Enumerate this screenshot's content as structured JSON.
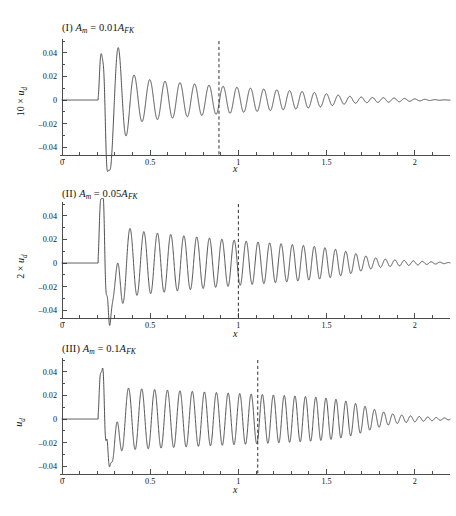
{
  "figure": {
    "background": "#ffffff",
    "curve_color": "#3c3c3c",
    "axis_color": "#4d4d4d",
    "marker_color": "#2e2e2e"
  },
  "panels": [
    {
      "id": "panel-I",
      "title_roman": "(I)",
      "title_full": "(I) A_m = 0.01A_FK",
      "amplitude_symbol": "A",
      "amplitude_sub": "m",
      "equals": " = ",
      "coefficient": "0.01",
      "reference_symbol": "A",
      "reference_sub": "FK",
      "ylabel_full": "10 × u_d",
      "ylabel_prefix": "10 × ",
      "ylabel_symbol": "u",
      "ylabel_sub": "d",
      "xlabel": "x",
      "yticks": [
        "0.04",
        "0.02",
        "0",
        "–0.02",
        "–0.04"
      ],
      "ytick_values": [
        0.04,
        0.02,
        0,
        -0.02,
        -0.04
      ],
      "xticks": [
        "0",
        "0.5",
        "1",
        "1.5",
        "2"
      ],
      "xtick_values": [
        0,
        0.5,
        1,
        1.5,
        2
      ],
      "marker_x": 0.89,
      "marker_label": "0.89"
    },
    {
      "id": "panel-II",
      "title_roman": "(II)",
      "title_full": "(II) A_m = 0.05A_FK",
      "amplitude_symbol": "A",
      "amplitude_sub": "m",
      "equals": " = ",
      "coefficient": "0.05",
      "reference_symbol": "A",
      "reference_sub": "FK",
      "ylabel_full": "2 × u_d",
      "ylabel_prefix": "2 × ",
      "ylabel_symbol": "u",
      "ylabel_sub": "d",
      "xlabel": "x",
      "yticks": [
        "0.04",
        "0.02",
        "0",
        "–0.02",
        "–0.04"
      ],
      "ytick_values": [
        0.04,
        0.02,
        0,
        -0.02,
        -0.04
      ],
      "xticks": [
        "0",
        "0.5",
        "1",
        "1.5",
        "2"
      ],
      "xtick_values": [
        0,
        0.5,
        1,
        1.5,
        2
      ],
      "marker_x": 1.0,
      "marker_label": "1"
    },
    {
      "id": "panel-III",
      "title_roman": "(III)",
      "title_full": "(III) A_m = 0.1A_FK",
      "amplitude_symbol": "A",
      "amplitude_sub": "m",
      "equals": " = ",
      "coefficient": "0.1",
      "reference_symbol": "A",
      "reference_sub": "FK",
      "ylabel_full": "u_d",
      "ylabel_prefix": "",
      "ylabel_symbol": "u",
      "ylabel_sub": "d",
      "xlabel": "x",
      "yticks": [
        "0.04",
        "0.02",
        "0",
        "–0.02",
        "–0.04"
      ],
      "ytick_values": [
        0.04,
        0.02,
        0,
        -0.02,
        -0.04
      ],
      "xticks": [
        "0",
        "0.5",
        "1",
        "1.5",
        "2"
      ],
      "xtick_values": [
        0,
        0.5,
        1,
        1.5,
        2
      ],
      "marker_x": 1.11,
      "marker_label": "1.11"
    }
  ],
  "chart_data": {
    "type": "line",
    "xlabel": "x",
    "ylabel": "scaled u_d",
    "xlim": [
      0,
      2.2
    ],
    "ylim": [
      -0.052,
      0.052
    ],
    "grid": false,
    "legend": "none",
    "panel_count": 3,
    "series": [
      {
        "name": "(I) A_m = 0.01A_FK",
        "ylabel": "10 × u_d",
        "onset_x": 0.205,
        "marker_x": 0.89,
        "wavelength_start": 0.093,
        "wavelength_end": 0.054,
        "peak_amplitude": 0.047,
        "peak_x": 0.292,
        "first_bump_amplitude": 0.021,
        "first_bump_x": 0.225,
        "deep_dip_amplitude": -0.041,
        "deep_dip_x": 0.252,
        "amplitude_at_marker": 0.021,
        "tail_decay_x": 1.85,
        "description": "Sharp onset near x=0.205 with a small precursor bump, a deep negative excursion, then a dominant positive peak of 0.047 near x=0.29 followed by monotonically decaying oscillations whose wavelength shortens from about 0.093 to 0.054; amplitude falls below 0.002 beyond x=1.8."
      },
      {
        "name": "(II) A_m = 0.05A_FK",
        "ylabel": "2 × u_d",
        "onset_x": 0.205,
        "marker_x": 1.0,
        "wavelength_start": 0.082,
        "wavelength_end": 0.048,
        "peak_amplitude": 0.045,
        "peak_x": 0.268,
        "first_bump_amplitude": 0.026,
        "first_bump_x": 0.222,
        "deep_dip_amplitude": -0.055,
        "deep_dip_x": 0.3,
        "amplitude_at_marker": 0.03,
        "tail_decay_x": 1.95,
        "description": "Similar sharp onset with a richer multi-lobed transient near x=0.22-0.33 including a deep negative excursion below -0.05, then a sustained train of oscillations of roughly 0.03 amplitude that persists further downstream than panel I before decaying beyond x=1.6."
      },
      {
        "name": "(III) A_m = 0.1A_FK",
        "ylabel": "u_d",
        "onset_x": 0.205,
        "marker_x": 1.11,
        "wavelength_start": 0.078,
        "wavelength_end": 0.046,
        "peak_amplitude": 0.028,
        "peak_x": 0.262,
        "first_bump_amplitude": 0.021,
        "first_bump_x": 0.222,
        "deep_dip_amplitude": -0.05,
        "deep_dip_x": 0.293,
        "amplitude_at_marker": 0.027,
        "tail_decay_x": 2.0,
        "description": "Onset transient is flatter-topped with peaks near 0.028, a deep negative excursion near -0.05, and a long nearly constant-amplitude oscillation train of about 0.027 that only decays slowly past the dashed marker at x=1.11."
      }
    ]
  }
}
